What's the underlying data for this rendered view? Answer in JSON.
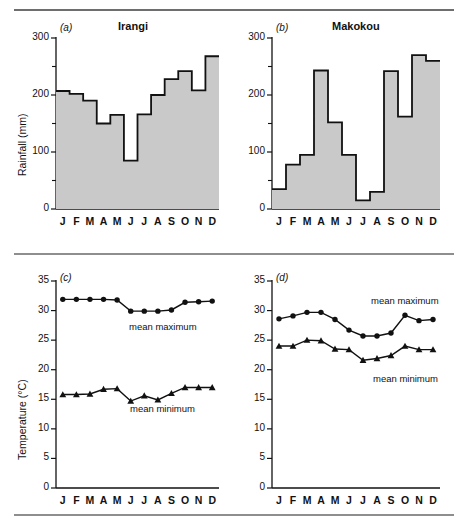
{
  "figure": {
    "axis_titles": {
      "rainfall": "Rainfall (mm)",
      "temperature": "Temperature (°C)"
    },
    "months": [
      "J",
      "F",
      "M",
      "A",
      "M",
      "J",
      "J",
      "A",
      "S",
      "O",
      "N",
      "D"
    ],
    "colors": {
      "bar_fill": "#c9c9c9",
      "bar_stroke": "#111111",
      "line": "#111111",
      "rule": "#7a7a7a",
      "text": "#111111"
    },
    "panels": [
      {
        "id": "a",
        "label": "(a)",
        "title": "Irangi"
      },
      {
        "id": "b",
        "label": "(b)",
        "title": "Makokou"
      },
      {
        "id": "c",
        "label": "(c)",
        "title": ""
      },
      {
        "id": "d",
        "label": "(d)",
        "title": ""
      }
    ],
    "series_labels": {
      "mean_maximum": "mean maximum",
      "mean_minimum": "mean minimum"
    }
  },
  "chart_data": [
    {
      "type": "bar",
      "panel": "a",
      "title": "Irangi",
      "xlabel": "",
      "ylabel": "Rainfall (mm)",
      "categories": [
        "J",
        "F",
        "M",
        "A",
        "M",
        "J",
        "J",
        "A",
        "S",
        "O",
        "N",
        "D"
      ],
      "values": [
        207,
        202,
        190,
        150,
        165,
        85,
        166,
        200,
        228,
        242,
        208,
        268
      ],
      "ylim": [
        0,
        300
      ],
      "yticks": [
        0,
        100,
        200,
        300
      ],
      "yticks_minor": [
        50,
        150,
        250
      ],
      "grid": false,
      "legend": "none"
    },
    {
      "type": "bar",
      "panel": "b",
      "title": "Makokou",
      "xlabel": "",
      "ylabel": "Rainfall (mm)",
      "categories": [
        "J",
        "F",
        "M",
        "A",
        "M",
        "J",
        "J",
        "A",
        "S",
        "O",
        "N",
        "D"
      ],
      "values": [
        35,
        78,
        95,
        243,
        152,
        95,
        15,
        30,
        242,
        162,
        270,
        260
      ],
      "ylim": [
        0,
        300
      ],
      "yticks": [
        0,
        100,
        200,
        300
      ],
      "yticks_minor": [
        50,
        150,
        250
      ],
      "grid": false,
      "legend": "none"
    },
    {
      "type": "line",
      "panel": "c",
      "title": "",
      "xlabel": "",
      "ylabel": "Temperature (°C)",
      "categories": [
        "J",
        "F",
        "M",
        "A",
        "M",
        "J",
        "J",
        "A",
        "S",
        "O",
        "N",
        "D"
      ],
      "series": [
        {
          "name": "mean maximum",
          "marker": "circle",
          "values": [
            31.9,
            31.9,
            31.9,
            31.9,
            31.8,
            29.9,
            29.9,
            29.9,
            30.1,
            31.4,
            31.5,
            31.6
          ]
        },
        {
          "name": "mean minimum",
          "marker": "triangle",
          "values": [
            15.8,
            15.8,
            15.9,
            16.7,
            16.8,
            14.7,
            15.6,
            14.9,
            16.0,
            17.0,
            17.0,
            17.0
          ]
        }
      ],
      "ylim": [
        0,
        35
      ],
      "yticks": [
        0,
        5,
        10,
        15,
        20,
        25,
        30,
        35
      ],
      "grid": false,
      "legend": "inline-annotation"
    },
    {
      "type": "line",
      "panel": "d",
      "title": "",
      "xlabel": "",
      "ylabel": "Temperature (°C)",
      "categories": [
        "J",
        "F",
        "M",
        "A",
        "M",
        "J",
        "J",
        "A",
        "S",
        "O",
        "N",
        "D"
      ],
      "series": [
        {
          "name": "mean maximum",
          "marker": "circle",
          "values": [
            28.6,
            29.1,
            29.7,
            29.7,
            28.5,
            26.7,
            25.7,
            25.7,
            26.2,
            29.2,
            28.3,
            28.5
          ]
        },
        {
          "name": "mean minimum",
          "marker": "triangle",
          "values": [
            24.0,
            24.0,
            25.0,
            24.9,
            23.5,
            23.4,
            21.6,
            21.9,
            22.4,
            24.0,
            23.4,
            23.4
          ]
        }
      ],
      "ylim": [
        0,
        35
      ],
      "yticks": [
        0,
        5,
        10,
        15,
        20,
        25,
        30,
        35
      ],
      "grid": false,
      "legend": "inline-annotation"
    }
  ]
}
